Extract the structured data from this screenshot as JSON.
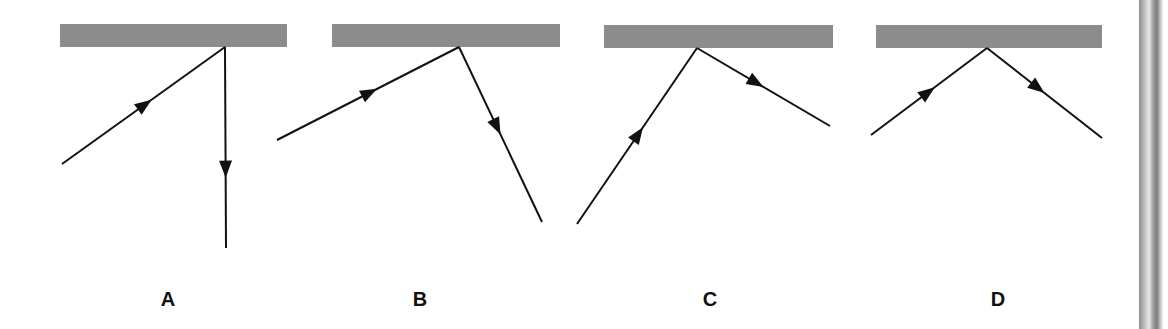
{
  "figure": {
    "panels": [
      {
        "label": "A",
        "mirror": {
          "x": 60,
          "y": 24,
          "w": 227,
          "h": 23
        },
        "point": [
          225,
          47
        ],
        "incident_start": [
          62,
          164
        ],
        "reflected_end": [
          226,
          248
        ],
        "label_x": 168
      },
      {
        "label": "B",
        "mirror": {
          "x": 332,
          "y": 24,
          "w": 228,
          "h": 23
        },
        "point": [
          459,
          47
        ],
        "incident_start": [
          277,
          140
        ],
        "reflected_end": [
          542,
          222
        ],
        "label_x": 420
      },
      {
        "label": "C",
        "mirror": {
          "x": 604,
          "y": 25,
          "w": 229,
          "h": 23
        },
        "point": [
          697,
          48
        ],
        "incident_start": [
          577,
          224
        ],
        "reflected_end": [
          830,
          126
        ],
        "label_x": 710
      },
      {
        "label": "D",
        "mirror": {
          "x": 876,
          "y": 25,
          "w": 226,
          "h": 23
        },
        "point": [
          987,
          48
        ],
        "incident_start": [
          871,
          135
        ],
        "reflected_end": [
          1102,
          138
        ],
        "label_x": 998
      }
    ],
    "colors": {
      "mirror": "#8c8c8c",
      "ray": "#111111"
    }
  }
}
